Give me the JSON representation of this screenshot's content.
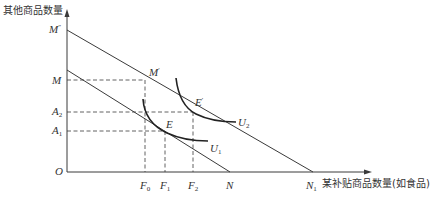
{
  "diagram": {
    "type": "indifference-curve-budget-line",
    "y_axis_label": "其他商品数量",
    "x_axis_label": "某补贴商品数量(如食品)",
    "origin_label": "O",
    "y_ticks": [
      {
        "id": "M2",
        "base": "M",
        "sup": "″"
      },
      {
        "id": "M",
        "base": "M",
        "sub": ""
      },
      {
        "id": "A2",
        "base": "A",
        "sub": "2"
      },
      {
        "id": "A1",
        "base": "A",
        "sub": "1"
      }
    ],
    "x_ticks": [
      {
        "id": "F0",
        "base": "F",
        "sub": "0"
      },
      {
        "id": "F1",
        "base": "F",
        "sub": "1"
      },
      {
        "id": "F2",
        "base": "F",
        "sub": "2"
      },
      {
        "id": "N",
        "base": "N",
        "sub": ""
      },
      {
        "id": "N1",
        "base": "N",
        "sub": "1"
      }
    ],
    "points": [
      {
        "id": "M_prime",
        "base": "M",
        "sup": "′"
      },
      {
        "id": "E_prime",
        "base": "E",
        "sup": "′"
      },
      {
        "id": "E",
        "base": "E",
        "sup": ""
      }
    ],
    "curves": [
      {
        "id": "U1",
        "base": "U",
        "sub": "1"
      },
      {
        "id": "U2",
        "base": "U",
        "sub": "2"
      }
    ],
    "lines": [
      {
        "id": "budget-original",
        "from": "y-axis",
        "to": "N"
      },
      {
        "id": "budget-subsidized",
        "from": "M″",
        "to": "N1"
      }
    ],
    "colors": {
      "line": "#3a3a3a",
      "text": "#333333",
      "background": "#ffffff"
    }
  }
}
